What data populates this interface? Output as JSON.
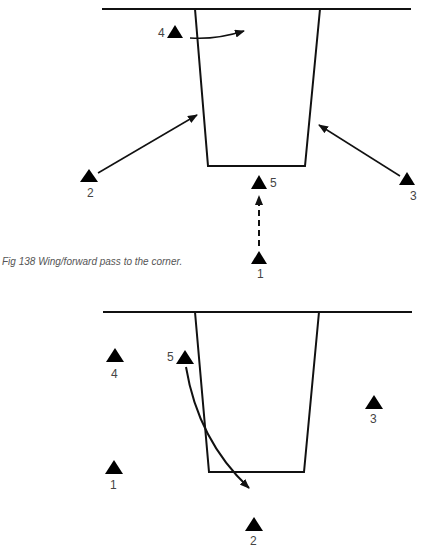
{
  "figure_138": {
    "caption": "Fig 138  Wing/forward pass to the corner.",
    "players": [
      {
        "label": "1"
      },
      {
        "label": "2"
      },
      {
        "label": "3"
      },
      {
        "label": "4"
      },
      {
        "label": "5"
      }
    ]
  },
  "figure_139": {
    "players": [
      {
        "label": "1"
      },
      {
        "label": "2"
      },
      {
        "label": "3"
      },
      {
        "label": "4"
      },
      {
        "label": "5"
      }
    ]
  }
}
